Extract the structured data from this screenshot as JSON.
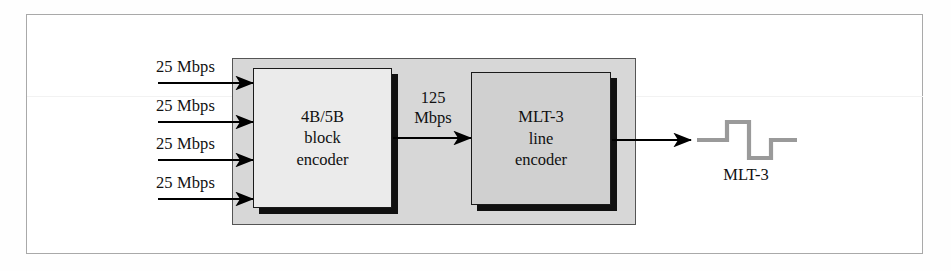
{
  "figure": {
    "colors": {
      "frame_border": "#a9a9a9",
      "container_fill": "#d7d7d7",
      "container_border": "#555555",
      "block_encoder_fill": "#ebebeb",
      "line_encoder_fill": "#d0d0d0",
      "box_border": "#1a1a1a",
      "shadow": "#101010",
      "arrow": "#000000",
      "waveform": "#9a9a9a",
      "text": "#111111"
    }
  },
  "inputs": [
    {
      "label": "25 Mbps"
    },
    {
      "label": "25 Mbps"
    },
    {
      "label": "25 Mbps"
    },
    {
      "label": "25 Mbps"
    }
  ],
  "blocks": {
    "block_encoder": {
      "lines": [
        "4B/5B",
        "block",
        "encoder"
      ]
    },
    "line_encoder": {
      "lines": [
        "MLT-3",
        "line",
        "encoder"
      ]
    }
  },
  "internal_link": {
    "rate_value": "125",
    "rate_unit": "Mbps"
  },
  "output": {
    "waveform_caption": "MLT-3"
  }
}
